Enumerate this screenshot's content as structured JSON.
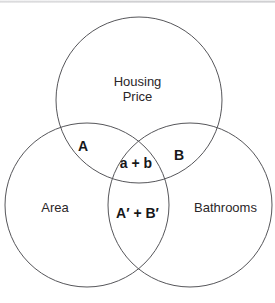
{
  "figure": {
    "type": "venn-diagram",
    "set_count": 3,
    "stroke_color": "#56565a",
    "background_color": "#ffffff",
    "text_color": "#231f20"
  },
  "sets": {
    "top": {
      "name": "housing-price",
      "label_line1": "Housing",
      "label_line2": "Price",
      "cx": 139,
      "cy": 100,
      "r": 83
    },
    "left": {
      "name": "area",
      "label": "Area",
      "cx": 87,
      "cy": 205,
      "r": 82
    },
    "right": {
      "name": "bathrooms",
      "label": "Bathrooms",
      "cx": 190,
      "cy": 205,
      "r": 82
    }
  },
  "regions": {
    "top_left_overlap": "A",
    "top_right_overlap": "B",
    "triple_overlap": "a + b",
    "left_right_overlap": "A′ + B′"
  }
}
